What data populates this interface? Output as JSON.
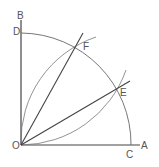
{
  "diagram": {
    "points": {
      "O": {
        "label": "O",
        "x": 21,
        "y": 145
      },
      "A": {
        "label": "A",
        "x": 140,
        "y": 145
      },
      "B": {
        "label": "B",
        "x": 21,
        "y": 20
      },
      "C": {
        "label": "C",
        "x": 131,
        "y": 145
      },
      "D": {
        "label": "D",
        "x": 21,
        "y": 33
      },
      "E": {
        "label": "E",
        "x": 117,
        "y": 89
      },
      "F": {
        "label": "F",
        "x": 77,
        "y": 46
      }
    },
    "stroke_color": "#555555",
    "line_color": "#444444"
  }
}
